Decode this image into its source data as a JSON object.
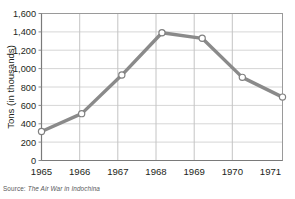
{
  "chart_data": {
    "type": "line",
    "title": "",
    "xlabel": "",
    "ylabel": "Tons (in thousands)",
    "categories": [
      "1965",
      "1966",
      "1967",
      "1968",
      "1969",
      "1970",
      "1971"
    ],
    "x": [
      1965,
      1966,
      1967,
      1968,
      1969,
      1970,
      1971
    ],
    "values": [
      315,
      510,
      930,
      1390,
      1330,
      905,
      690
    ],
    "series": [
      {
        "name": "Tons of bombs dropped",
        "values": [
          315,
          510,
          930,
          1390,
          1330,
          905,
          690
        ]
      }
    ],
    "ylim": [
      0,
      1600
    ],
    "ytick_labels": [
      "0",
      "200",
      "400",
      "600",
      "800",
      "1,000",
      "1,200",
      "1,400",
      "1,600"
    ],
    "ytick_values": [
      0,
      200,
      400,
      600,
      800,
      1000,
      1200,
      1400,
      1600
    ],
    "xtick_labels": [
      "1965",
      "1966",
      "1967",
      "1968",
      "1969",
      "1970",
      "1971"
    ],
    "grid": "both",
    "legend_position": "none",
    "line_color": "#8a8a8a",
    "marker_fill": "#ffffff",
    "marker_edge_color": "#808080",
    "gridline_color": "#d6d6d6",
    "axis_color": "#8a8a8a"
  },
  "source_note": {
    "prefix": "Source:",
    "title": "The Air War in Indochina"
  }
}
